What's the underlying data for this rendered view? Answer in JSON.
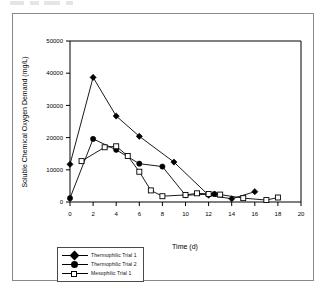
{
  "figure": {
    "border_color": "#8a8a8a",
    "background": "#ffffff"
  },
  "chart_data": {
    "type": "line",
    "title": "",
    "xlabel": "Time (d)",
    "ylabel": "Soluble Chemical Oxygen Demand (mg/L)",
    "xlim": [
      0,
      20
    ],
    "ylim": [
      0,
      50000
    ],
    "xticks": [
      0,
      2,
      4,
      6,
      8,
      10,
      12,
      14,
      16,
      18,
      20
    ],
    "xtick_labels": [
      "0",
      "2",
      "4",
      "6",
      "8",
      "10",
      "12",
      "14",
      "16",
      "18",
      "20"
    ],
    "yticks": [
      0,
      10000,
      20000,
      30000,
      40000,
      50000
    ],
    "ytick_labels": [
      "0",
      "10000",
      "20000",
      "30000",
      "40000",
      "50000"
    ],
    "grid": false,
    "legend_position": "below-left",
    "series": [
      {
        "name": "Thermophilic Trial 1",
        "marker": "filled-diamond",
        "color": "#000000",
        "x": [
          0,
          2,
          4,
          6,
          9,
          12,
          14,
          16
        ],
        "y": [
          11700,
          38700,
          26700,
          20400,
          12400,
          2100,
          1000,
          3200
        ]
      },
      {
        "name": "Thermophilic Trial 2",
        "marker": "filled-circle",
        "color": "#000000",
        "x": [
          0,
          2,
          4,
          6,
          8,
          10,
          12.5
        ],
        "y": [
          1200,
          19600,
          16200,
          11900,
          11000,
          2100,
          2500
        ]
      },
      {
        "name": "Mesophilic Trial 1",
        "marker": "open-square",
        "color": "#000000",
        "x": [
          1,
          3,
          4,
          5,
          6,
          7,
          8,
          10,
          11,
          12,
          13,
          15,
          17,
          18
        ],
        "y": [
          12700,
          17000,
          17300,
          14300,
          9400,
          3600,
          1800,
          2200,
          2700,
          2500,
          2300,
          1200,
          600,
          1400
        ]
      }
    ]
  },
  "legend": {
    "items": [
      {
        "label": "Thermophilic Trial 1",
        "marker": "filled-diamond"
      },
      {
        "label": "Thermophilic Trial 2",
        "marker": "filled-circle"
      },
      {
        "label": "Mesophilic Trial 1",
        "marker": "open-square"
      }
    ]
  }
}
